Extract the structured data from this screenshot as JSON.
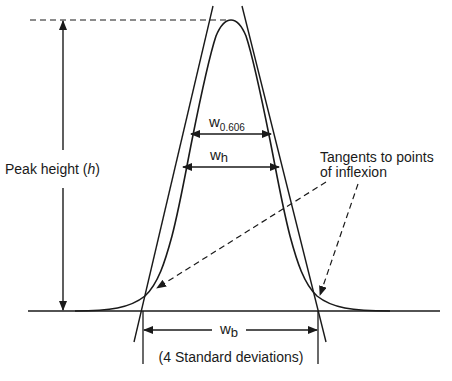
{
  "diagram": {
    "labels": {
      "peak_height": "Peak height (",
      "peak_height_symbol": "h",
      "peak_height_close": ")",
      "w0606_main": "w",
      "w0606_sub": "0.606",
      "wh_main": "w",
      "wh_sub": "h",
      "wb_main": "w",
      "wb_sub": "b",
      "std_dev": "(4 Standard deviations)",
      "tangents_line1": "Tangents to points",
      "tangents_line2": "of inflexion"
    },
    "colors": {
      "ink": "#1a1a1a",
      "background": "#ffffff"
    }
  }
}
